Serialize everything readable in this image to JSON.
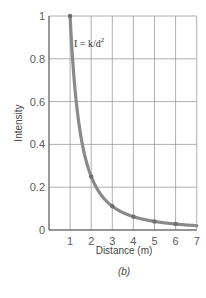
{
  "chart_data": {
    "type": "line",
    "title": "",
    "annotation": "I = k/d²",
    "xlabel": "Distance (m)",
    "ylabel": "Intensity",
    "caption": "(b)",
    "xlim": [
      0,
      7
    ],
    "ylim": [
      0,
      1
    ],
    "x_ticks": [
      1,
      2,
      3,
      4,
      5,
      6,
      7
    ],
    "y_ticks": [
      0,
      0.2,
      0.4,
      0.6,
      0.8,
      1
    ],
    "y_tick_labels": [
      "0",
      "0.2",
      "0.4",
      "0.6",
      "0.8",
      "1"
    ],
    "grid": true,
    "legend": null,
    "series": [
      {
        "name": "I = k/d²",
        "x": [
          1,
          2,
          3,
          4,
          5,
          6,
          7
        ],
        "y": [
          1.0,
          0.25,
          0.111,
          0.0625,
          0.04,
          0.028,
          0.02
        ],
        "markers": [
          1,
          2,
          3,
          4,
          5,
          6
        ]
      }
    ],
    "colors": {
      "curve": "#8a8a8a",
      "grid": "#9a9a9a",
      "axis": "#555555"
    }
  }
}
